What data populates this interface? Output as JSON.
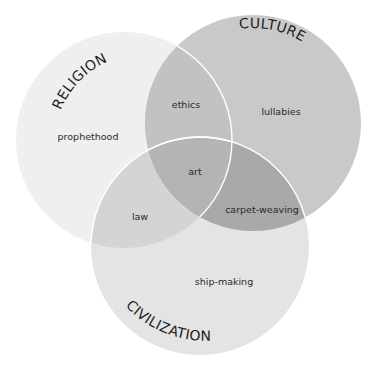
{
  "diagram": {
    "type": "venn",
    "colors": {
      "background": "#ffffff",
      "religion_fill": "#efefef",
      "culture_fill": "#c9c9c9",
      "civilization_fill": "#e4e4e4",
      "religion_culture": "#c2c2c2",
      "religion_civilization": "#d4d4d4",
      "culture_civilization": "#a9a9a9",
      "all_three": "#b4b4b4",
      "outline": "#ffffff",
      "text": "#2a2a2a"
    },
    "sets": [
      {
        "id": "religion",
        "title": "RELIGION"
      },
      {
        "id": "culture",
        "title": "CULTURE"
      },
      {
        "id": "civilization",
        "title": "CIVILIZATION"
      }
    ],
    "regions": {
      "religion_only": "prophethood",
      "culture_only": "lullabies",
      "civilization_only": "ship-making",
      "religion_culture": "ethics",
      "religion_civilization": "law",
      "culture_civilization": "carpet-weaving",
      "all_three": "art"
    }
  }
}
